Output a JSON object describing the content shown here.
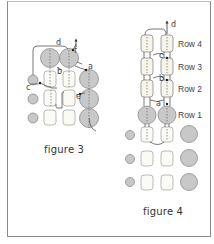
{
  "figures": [
    {
      "caption": "figure 3",
      "labels": {
        "a": "a",
        "b": "b",
        "c": "c",
        "d": "d",
        "e": "e",
        "f": "f"
      }
    },
    {
      "caption": "figure 4",
      "labels": {
        "a": "a",
        "b": "b",
        "c": "c",
        "d": "d"
      },
      "rows": [
        "Row 4",
        "Row 3",
        "Row 2",
        "Row 1"
      ]
    }
  ],
  "colors": {
    "circle_fill": "#c8c8c8",
    "circle_stroke": "#8c8c8c",
    "square_stroke": "#a8a8a8",
    "line": "#555555",
    "frame": "#8a8a8a"
  }
}
